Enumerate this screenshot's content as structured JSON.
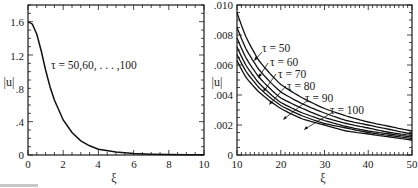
{
  "chart_data": [
    {
      "type": "line",
      "panel": "left",
      "title": "",
      "xlabel": "ξ",
      "ylabel": "|u|",
      "xlim": [
        0,
        10
      ],
      "ylim": [
        0,
        1.8
      ],
      "xticks": [
        "0",
        "2",
        "4",
        "6",
        "8",
        "10"
      ],
      "yticks": [
        "0",
        ".4",
        ".8",
        "1.2",
        "1.6"
      ],
      "grid": false,
      "annotations": [
        "τ = 50,60, . . . ,100"
      ],
      "series": [
        {
          "name": "τ = 50,60,...,100 (coincident)",
          "x": [
            0,
            0.25,
            0.5,
            0.75,
            1.0,
            1.25,
            1.5,
            2.0,
            2.5,
            3.0,
            3.5,
            4.0,
            5.0,
            6.0,
            7.0,
            8.0,
            9.0,
            10.0
          ],
          "values": [
            1.6,
            1.57,
            1.45,
            1.25,
            1.02,
            0.82,
            0.66,
            0.42,
            0.27,
            0.17,
            0.11,
            0.07,
            0.035,
            0.018,
            0.01,
            0.005,
            0.003,
            0.002
          ]
        }
      ]
    },
    {
      "type": "line",
      "panel": "right",
      "title": "",
      "xlabel": "ξ",
      "ylabel": "|u|",
      "xlim": [
        10,
        50
      ],
      "ylim": [
        0,
        0.01
      ],
      "xticks": [
        "10",
        "20",
        "30",
        "40",
        "50"
      ],
      "yticks": [
        "0",
        ".002",
        ".004",
        ".006",
        ".008",
        ".010"
      ],
      "grid": false,
      "legend_position": "inline labels with leader arrows",
      "x": [
        10,
        12,
        15,
        20,
        25,
        30,
        35,
        40,
        45,
        50
      ],
      "series": [
        {
          "name": "τ = 50",
          "values": [
            0.0095,
            0.0079,
            0.0063,
            0.0047,
            0.0038,
            0.0031,
            0.0026,
            0.0022,
            0.0019,
            0.0016
          ]
        },
        {
          "name": "τ = 60",
          "values": [
            0.0085,
            0.0071,
            0.0057,
            0.0042,
            0.0034,
            0.0028,
            0.0023,
            0.002,
            0.0017,
            0.0014
          ]
        },
        {
          "name": "τ = 70",
          "values": [
            0.0078,
            0.0065,
            0.0052,
            0.0038,
            0.0031,
            0.0025,
            0.0021,
            0.0018,
            0.0015,
            0.0013
          ]
        },
        {
          "name": "τ = 80",
          "values": [
            0.0072,
            0.006,
            0.0048,
            0.0035,
            0.0028,
            0.0023,
            0.0019,
            0.0016,
            0.0014,
            0.0012
          ]
        },
        {
          "name": "τ = 90",
          "values": [
            0.0067,
            0.0056,
            0.0045,
            0.0033,
            0.0026,
            0.0021,
            0.0018,
            0.0015,
            0.0013,
            0.0011
          ]
        },
        {
          "name": "τ = 100",
          "values": [
            0.0063,
            0.0052,
            0.0042,
            0.0031,
            0.0024,
            0.002,
            0.0016,
            0.0014,
            0.0012,
            0.001
          ]
        }
      ]
    }
  ],
  "left": {
    "ylabel": "|u|",
    "xlabel": "ξ",
    "annotation": "τ = 50,60, . . . ,100",
    "xticks": [
      "0",
      "2",
      "4",
      "6",
      "8",
      "10"
    ],
    "yticks": [
      "0",
      ".4",
      ".8",
      "1.2",
      "1.6"
    ]
  },
  "right": {
    "ylabel": "|u|",
    "xlabel": "ξ",
    "xticks": [
      "10",
      "20",
      "30",
      "40",
      "50"
    ],
    "yticks": [
      "0",
      ".002",
      ".004",
      ".006",
      ".008",
      ".010"
    ],
    "labels": [
      "τ = 50",
      "τ = 60",
      "τ = 70",
      "τ = 80",
      "τ = 90",
      "τ = 100"
    ]
  }
}
